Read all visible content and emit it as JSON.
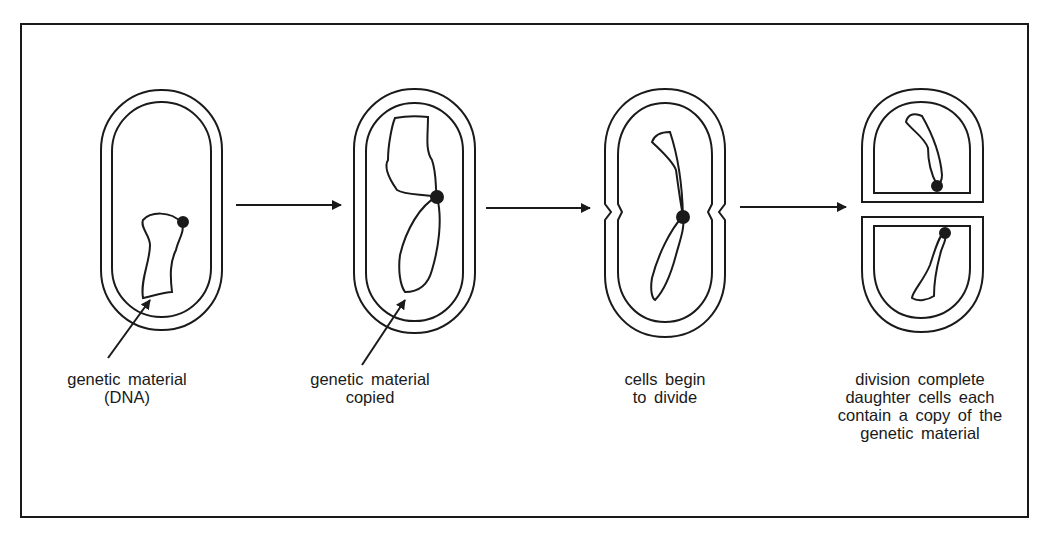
{
  "diagram": {
    "stroke_color": "#1a1a1a",
    "background": "#ffffff",
    "stages": [
      {
        "id": "stage-1",
        "label_lines": [
          "genetic material",
          "(DNA)"
        ],
        "has_pointer_arrow": true
      },
      {
        "id": "stage-2",
        "label_lines": [
          "genetic material",
          "copied"
        ],
        "has_pointer_arrow": true
      },
      {
        "id": "stage-3",
        "label_lines": [
          "cells begin",
          "to divide"
        ],
        "has_pointer_arrow": false
      },
      {
        "id": "stage-4",
        "label_lines": [
          "division complete",
          "daughter cells each",
          "contain a copy of the",
          "genetic material"
        ],
        "has_pointer_arrow": false
      }
    ],
    "flow_arrows": [
      {
        "from": "stage-1",
        "to": "stage-2"
      },
      {
        "from": "stage-2",
        "to": "stage-3"
      },
      {
        "from": "stage-3",
        "to": "stage-4"
      }
    ]
  }
}
